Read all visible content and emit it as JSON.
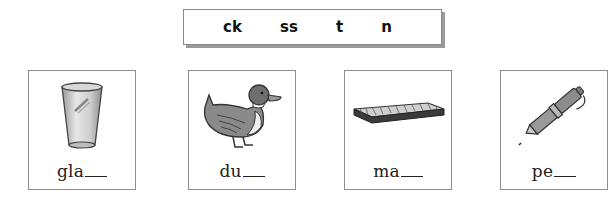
{
  "word_bank": {
    "items": [
      "ck",
      "ss",
      "t",
      "n"
    ]
  },
  "cards": [
    {
      "picture": "glass",
      "stem": "gla"
    },
    {
      "picture": "duck",
      "stem": "du"
    },
    {
      "picture": "mat",
      "stem": "ma"
    },
    {
      "picture": "pen",
      "stem": "pe"
    }
  ]
}
